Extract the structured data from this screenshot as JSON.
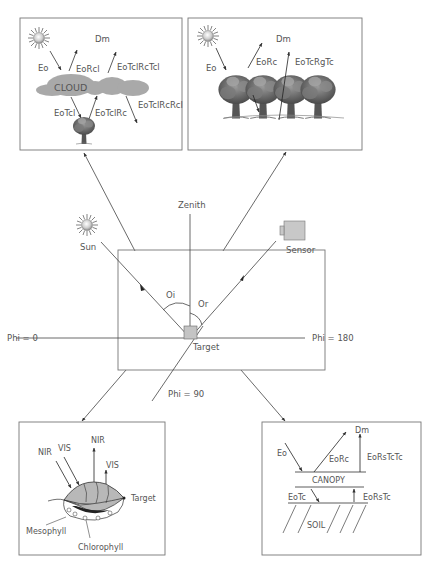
{
  "diagram": {
    "colors": {
      "line": "#444444",
      "box": "#777777",
      "text": "#555555",
      "cloud": "#a9a9a9",
      "target_fill": "#c4c4c4",
      "sensor_fill": "#c8c8c8",
      "leaf_fill": "#b8b8b8",
      "leaf_dark": "#222222"
    },
    "center": {
      "zenith_label": "Zenith",
      "sun_label": "Sun",
      "sensor_label": "Sensor",
      "theta_i_label": "Oi",
      "theta_r_label": "Or",
      "target_label": "Target",
      "phi_0_label": "Phi = 0",
      "phi_180_label": "Phi = 180",
      "phi_90_label": "Phi = 90"
    },
    "panel_cloud": {
      "dm_label": "Dm",
      "eo_label": "Eo",
      "eorcl_label": "EoRcl",
      "eotclrctcl_label": "EoTclRcTcl",
      "cloud_label": "CLOUD",
      "eotcl_label": "EoTcl",
      "eotclrc_label": "EoTclRc",
      "eotclrcrcl_label": "EoTclRcRcl"
    },
    "panel_forest": {
      "dm_label": "Dm",
      "eo_label": "Eo",
      "eorc_label": "EoRc",
      "eotcrgtc_label": "EoTcRgTc"
    },
    "panel_leaf": {
      "nir_in_label": "NIR",
      "vis_in_label": "VIS",
      "nir_out_label": "NIR",
      "vis_out_label": "VIS",
      "target_label": "Target",
      "mesophyll_label": "Mesophyll",
      "chlorophyll_label": "Chlorophyll"
    },
    "panel_canopy": {
      "dm_label": "Dm",
      "eo_label": "Eo",
      "eorc_label": "EoRc",
      "eorstctc_label": "EoRsTcTc",
      "canopy_label": "CANOPY",
      "eotc_label": "EoTc",
      "eorstc_label": "EoRsTc",
      "soil_label": "SOIL"
    },
    "icons": {
      "sun": "sun-icon",
      "sensor": "camera-sensor-icon",
      "tree": "tree-icon",
      "cloud": "cloud-icon",
      "leaf": "leaf-icon"
    }
  }
}
